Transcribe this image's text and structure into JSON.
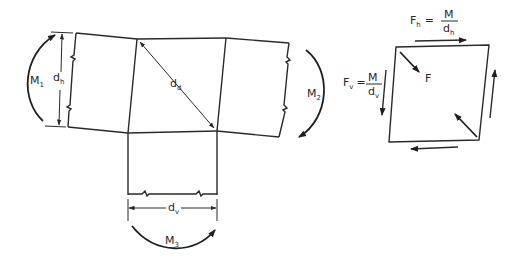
{
  "diagram": {
    "type": "beam-column joint shear panel",
    "labels": {
      "m1": {
        "main": "M",
        "sub": "1"
      },
      "m2": {
        "main": "M",
        "sub": "2"
      },
      "m3": {
        "main": "M",
        "sub": "3"
      },
      "dh": {
        "main": "d",
        "sub": "h"
      },
      "dd": {
        "main": "d",
        "sub": "d"
      },
      "dv": {
        "main": "d",
        "sub": "v"
      }
    },
    "equations": {
      "fh": {
        "lhs_main": "F",
        "lhs_sub": "h",
        "eq": "=",
        "num": "M",
        "den_main": "d",
        "den_sub": "h"
      },
      "fv": {
        "lhs_main": "F",
        "lhs_sub": "v",
        "eq": "=",
        "num": "M",
        "den_main": "d",
        "den_sub": "v"
      }
    },
    "force_label": "F",
    "colors": {
      "line": "#2a2a2a",
      "background": "#ffffff"
    }
  }
}
